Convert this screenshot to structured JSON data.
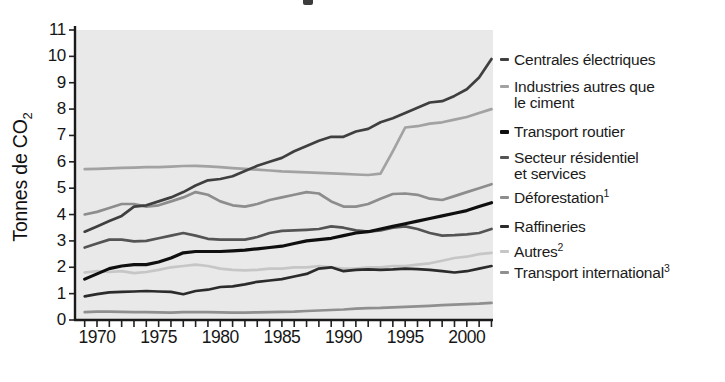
{
  "figure": {
    "y_axis_title_main": "Tonnes de CO",
    "y_axis_title_sub": "2"
  },
  "legend": {
    "items": [
      {
        "label": "Centrales électriques",
        "label2": "",
        "sup": ""
      },
      {
        "label": "Industries autres que",
        "label2": "le ciment",
        "sup": ""
      },
      {
        "label": "Transport routier",
        "label2": "",
        "sup": ""
      },
      {
        "label": "Secteur résidentiel",
        "label2": "et services",
        "sup": ""
      },
      {
        "label": "Déforestation",
        "label2": "",
        "sup": "1"
      },
      {
        "label": "Raffineries",
        "label2": "",
        "sup": ""
      },
      {
        "label": "Autres",
        "label2": "",
        "sup": "2"
      },
      {
        "label": "Transport international",
        "label2": "",
        "sup": "3"
      }
    ]
  },
  "chart_data": {
    "type": "line",
    "title": "",
    "xlabel": "",
    "ylabel": "Tonnes de CO2",
    "ylim": [
      0,
      11
    ],
    "xlim": [
      1969,
      2002
    ],
    "grid": false,
    "legend_position": "right",
    "plot_bg": "#eae9ea",
    "axis_color": "#1a1a1a",
    "y_ticks": [
      0,
      1,
      2,
      3,
      4,
      5,
      6,
      7,
      8,
      9,
      10,
      11
    ],
    "x_tick_labels": [
      1970,
      1975,
      1980,
      1985,
      1990,
      1995,
      2000
    ],
    "x": [
      1969,
      1970,
      1971,
      1972,
      1973,
      1974,
      1975,
      1976,
      1977,
      1978,
      1979,
      1980,
      1981,
      1982,
      1983,
      1984,
      1985,
      1986,
      1987,
      1988,
      1989,
      1990,
      1991,
      1992,
      1993,
      1994,
      1995,
      1996,
      1997,
      1998,
      1999,
      2000,
      2001,
      2002
    ],
    "series": [
      {
        "name": "Centrales électriques",
        "color": "#3f3f3f",
        "stroke_width": 2.7,
        "values": [
          3.35,
          3.55,
          3.75,
          3.95,
          4.3,
          4.35,
          4.5,
          4.65,
          4.85,
          5.1,
          5.3,
          5.35,
          5.45,
          5.65,
          5.85,
          6.0,
          6.15,
          6.4,
          6.6,
          6.8,
          6.95,
          6.95,
          7.15,
          7.25,
          7.5,
          7.65,
          7.85,
          8.05,
          8.25,
          8.3,
          8.5,
          8.75,
          9.2,
          9.9
        ]
      },
      {
        "name": "Industries autres que le ciment",
        "color": "#a2a2a2",
        "stroke_width": 2.7,
        "values": [
          5.72,
          5.73,
          5.75,
          5.77,
          5.78,
          5.8,
          5.8,
          5.82,
          5.84,
          5.85,
          5.83,
          5.8,
          5.76,
          5.73,
          5.7,
          5.67,
          5.64,
          5.62,
          5.6,
          5.58,
          5.56,
          5.54,
          5.52,
          5.5,
          5.55,
          6.4,
          7.3,
          7.35,
          7.45,
          7.5,
          7.6,
          7.7,
          7.85,
          8.0
        ]
      },
      {
        "name": "Transport routier",
        "color": "#0f0f0f",
        "stroke_width": 3.2,
        "values": [
          1.55,
          1.75,
          1.95,
          2.05,
          2.1,
          2.1,
          2.2,
          2.35,
          2.55,
          2.6,
          2.6,
          2.6,
          2.62,
          2.65,
          2.7,
          2.75,
          2.8,
          2.9,
          3.0,
          3.05,
          3.1,
          3.2,
          3.3,
          3.35,
          3.45,
          3.55,
          3.65,
          3.75,
          3.85,
          3.95,
          4.05,
          4.15,
          4.3,
          4.45
        ]
      },
      {
        "name": "Secteur résidentiel et services",
        "color": "#545454",
        "stroke_width": 2.7,
        "values": [
          2.75,
          2.9,
          3.05,
          3.05,
          2.98,
          3.0,
          3.1,
          3.2,
          3.3,
          3.2,
          3.08,
          3.05,
          3.05,
          3.05,
          3.15,
          3.3,
          3.38,
          3.4,
          3.42,
          3.45,
          3.55,
          3.5,
          3.4,
          3.35,
          3.4,
          3.5,
          3.55,
          3.45,
          3.3,
          3.2,
          3.22,
          3.25,
          3.3,
          3.45
        ]
      },
      {
        "name": "Déforestation",
        "color": "#8d8d8d",
        "stroke_width": 2.7,
        "values": [
          4.0,
          4.1,
          4.25,
          4.4,
          4.4,
          4.3,
          4.35,
          4.5,
          4.65,
          4.85,
          4.75,
          4.5,
          4.35,
          4.3,
          4.4,
          4.55,
          4.65,
          4.75,
          4.85,
          4.8,
          4.5,
          4.3,
          4.3,
          4.4,
          4.6,
          4.78,
          4.8,
          4.75,
          4.6,
          4.55,
          4.7,
          4.85,
          5.0,
          5.15
        ]
      },
      {
        "name": "Raffineries",
        "color": "#2b2b2b",
        "stroke_width": 2.7,
        "values": [
          0.9,
          0.98,
          1.05,
          1.07,
          1.08,
          1.1,
          1.08,
          1.07,
          0.98,
          1.1,
          1.15,
          1.25,
          1.28,
          1.35,
          1.45,
          1.5,
          1.55,
          1.65,
          1.75,
          1.95,
          2.0,
          1.85,
          1.9,
          1.92,
          1.9,
          1.92,
          1.95,
          1.93,
          1.9,
          1.85,
          1.8,
          1.85,
          1.95,
          2.05
        ]
      },
      {
        "name": "Autres",
        "color": "#c6c6c6",
        "stroke_width": 2.7,
        "values": [
          1.8,
          1.85,
          1.82,
          1.85,
          1.78,
          1.82,
          1.9,
          2.0,
          2.05,
          2.1,
          2.05,
          1.95,
          1.9,
          1.88,
          1.9,
          1.95,
          1.95,
          2.0,
          2.0,
          2.05,
          2.0,
          1.95,
          1.95,
          2.0,
          2.0,
          2.05,
          2.05,
          2.1,
          2.15,
          2.25,
          2.35,
          2.4,
          2.5,
          2.55
        ]
      },
      {
        "name": "Transport international",
        "color": "#8f8f8f",
        "stroke_width": 2.7,
        "values": [
          0.3,
          0.32,
          0.32,
          0.31,
          0.3,
          0.3,
          0.29,
          0.28,
          0.3,
          0.3,
          0.3,
          0.29,
          0.28,
          0.28,
          0.29,
          0.3,
          0.31,
          0.32,
          0.34,
          0.36,
          0.38,
          0.4,
          0.43,
          0.45,
          0.46,
          0.48,
          0.5,
          0.52,
          0.54,
          0.56,
          0.58,
          0.6,
          0.62,
          0.65
        ]
      }
    ]
  }
}
